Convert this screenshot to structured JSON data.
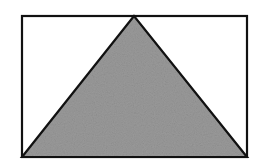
{
  "diagram": {
    "canvas": {
      "width": 256,
      "height": 161,
      "background": "#ffffff"
    },
    "rectangle": {
      "x": 22,
      "y": 16,
      "width": 225,
      "height": 141,
      "stroke": "#111111",
      "stroke_width": 2.2,
      "fill": "#ffffff"
    },
    "triangle": {
      "points": [
        [
          134,
          16
        ],
        [
          22,
          157
        ],
        [
          247,
          157
        ]
      ],
      "fill": "#9a9a9a",
      "stroke": "#111111",
      "stroke_width": 2.2,
      "texture": "grain"
    }
  }
}
